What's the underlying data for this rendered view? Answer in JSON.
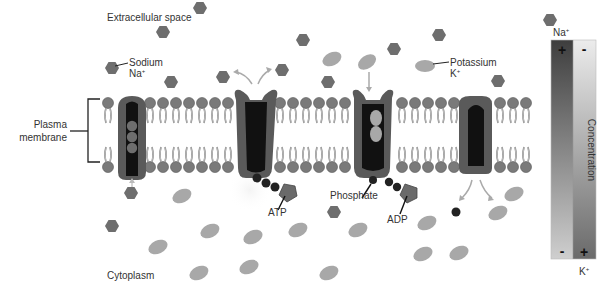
{
  "regions": {
    "extracellular": "Extracellular space",
    "cytoplasm": "Cytoplasm",
    "membrane_line1": "Plasma",
    "membrane_line2": "membrane"
  },
  "legend": {
    "sodium_name": "Sodium",
    "sodium_symbol": "Na",
    "potassium_name": "Potassium",
    "potassium_symbol": "K",
    "plus_sign": "+"
  },
  "molecules": {
    "atp": "ATP",
    "adp": "ADP",
    "phosphate": "Phosphate"
  },
  "gradient_bar": {
    "top_ion": "Na",
    "bottom_ion": "K",
    "axis_label": "Concentration",
    "top_left_sign": "+",
    "top_right_sign": "-",
    "bottom_left_sign": "-",
    "bottom_right_sign": "+"
  },
  "colors": {
    "sodium": "#6e6e6e",
    "potassium": "#a8a8a8",
    "protein": "#5a5a5a",
    "protein_core": "#111111",
    "lipid_head": "#7a7a7a",
    "gradient_dark": "#4a4a4a",
    "gradient_light": "#e4e4e4"
  }
}
